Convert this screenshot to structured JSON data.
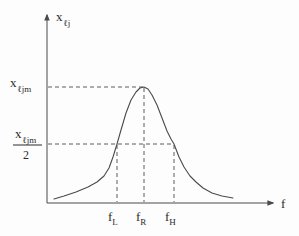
{
  "figure": {
    "y_axis_label": {
      "base": "x",
      "sub": "ℓj"
    },
    "x_axis_label": "f",
    "peak_level_label": {
      "base": "x",
      "sub": "ℓjm"
    },
    "half_level_label": {
      "numerator_base": "x",
      "numerator_sub": "ℓjm",
      "denominator": "2"
    },
    "x_tick_labels": [
      {
        "base": "f",
        "sub": "L"
      },
      {
        "base": "f",
        "sub": "R"
      },
      {
        "base": "f",
        "sub": "H"
      }
    ]
  },
  "chart_data": {
    "type": "line",
    "title": "",
    "xlabel": "f",
    "ylabel": "x_ℓj",
    "x_tick_labels": [
      "f_L",
      "f_R",
      "f_H"
    ],
    "y_reference_levels": [
      "x_ℓjm",
      "x_ℓjm/2"
    ],
    "curve_points_px": [
      [
        54,
        199
      ],
      [
        64,
        196
      ],
      [
        76,
        192
      ],
      [
        88,
        187
      ],
      [
        97,
        182
      ],
      [
        104,
        176
      ],
      [
        109,
        168
      ],
      [
        113,
        157
      ],
      [
        117,
        144
      ],
      [
        121,
        130
      ],
      [
        126,
        113
      ],
      [
        131,
        100
      ],
      [
        136,
        92
      ],
      [
        140,
        88
      ],
      [
        144,
        87
      ],
      [
        148,
        89
      ],
      [
        152,
        95
      ],
      [
        157,
        105
      ],
      [
        162,
        118
      ],
      [
        167,
        131
      ],
      [
        171,
        139
      ],
      [
        174,
        144
      ],
      [
        179,
        157
      ],
      [
        184,
        167
      ],
      [
        190,
        176
      ],
      [
        196,
        182
      ],
      [
        203,
        188
      ],
      [
        212,
        193
      ],
      [
        222,
        196
      ],
      [
        233,
        198
      ]
    ],
    "guide_lines_px": {
      "peak_level_y": 87,
      "half_level_y": 144,
      "f_L_x": 117,
      "f_R_x": 144,
      "f_H_x": 174,
      "axis_origin": [
        47,
        203
      ]
    }
  },
  "colors": {
    "line": "#4a4a4a",
    "text": "#2b2b2b",
    "background": "#fdfdfd"
  }
}
